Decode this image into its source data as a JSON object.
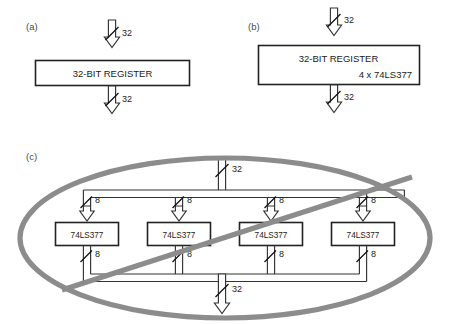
{
  "figure": {
    "background_color": "#ffffff",
    "line_color": "#333333",
    "annotation_color": "#8c8c8c"
  },
  "panels": [
    {
      "id": "a",
      "label": "(a)",
      "box": {
        "line1": "32-BIT REGISTER",
        "line2": ""
      },
      "input_bus_label": "32",
      "output_bus_label": "32"
    },
    {
      "id": "b",
      "label": "(b)",
      "box": {
        "line1": "32-BIT REGISTER",
        "line2": "4 x 74LS377"
      },
      "input_bus_label": "32",
      "output_bus_label": "32"
    },
    {
      "id": "c",
      "label": "(c)",
      "input_bus_label": "32",
      "output_bus_label": "32",
      "chips": [
        {
          "name": "74LS377",
          "input_label": "8",
          "output_label": "8"
        },
        {
          "name": "74LS377",
          "input_label": "8",
          "output_label": "8"
        },
        {
          "name": "74LS377",
          "input_label": "8",
          "output_label": "8"
        },
        {
          "name": "74LS377",
          "input_label": "8",
          "output_label": "8"
        }
      ],
      "annotation": {
        "shape": "ellipse-with-diagonal-slash",
        "meaning": "crossed-out"
      }
    }
  ]
}
